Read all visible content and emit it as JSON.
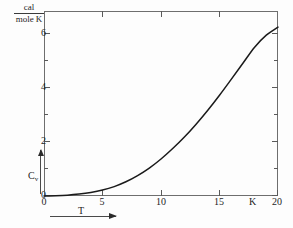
{
  "chart_data": {
    "type": "line",
    "title": "",
    "subtitle": "",
    "xlabel": "T",
    "ylabel": "C_v",
    "x_unit": "K",
    "y_unit_numerator": "cal",
    "y_unit_denominator": "mole K",
    "xlim": [
      0,
      20
    ],
    "ylim": [
      0,
      6.9
    ],
    "grid": false,
    "legend": null,
    "x_major_ticks": [
      0,
      5,
      10,
      15,
      20
    ],
    "x_major_tick_labels": [
      "0",
      "5",
      "10",
      "15",
      "20"
    ],
    "x_minor_tick_step": 1,
    "y_major_ticks": [
      0,
      2,
      4,
      6
    ],
    "y_major_tick_labels": [
      "0",
      "2",
      "4",
      "6"
    ],
    "y_minor_tick_step": 1,
    "series": [
      {
        "name": "Cv",
        "x": [
          0,
          1,
          2,
          3,
          4,
          5,
          6,
          7,
          8,
          9,
          10,
          11,
          12,
          13,
          14,
          15,
          16,
          17,
          18,
          19,
          20
        ],
        "values": [
          0.0,
          0.01,
          0.03,
          0.07,
          0.13,
          0.22,
          0.35,
          0.53,
          0.76,
          1.04,
          1.38,
          1.77,
          2.2,
          2.68,
          3.2,
          3.76,
          4.35,
          4.95,
          5.55,
          6.0,
          6.3
        ]
      }
    ],
    "annotations": []
  },
  "axis_labels": {
    "y_variable": "C",
    "y_variable_subscript": "v",
    "x_variable": "T",
    "x_unit": "K"
  },
  "units": {
    "numerator": "cal",
    "denominator": "mole K"
  },
  "icons": {
    "y_arrow": "arrow-up-icon",
    "x_arrow": "arrow-right-icon"
  },
  "colors": {
    "curve": "#1a1a1a",
    "frame": "#6e6e6e",
    "tick": "#5a5a5a",
    "text": "#1d1d1d",
    "background": "#fdfdfd"
  }
}
